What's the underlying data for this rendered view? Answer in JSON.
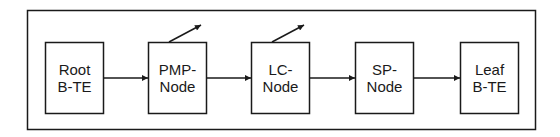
{
  "diagram": {
    "type": "block-flow",
    "colors": {
      "stroke": "#1a1a1a",
      "background": "#ffffff"
    },
    "nodes": [
      {
        "id": "root",
        "lines": [
          "Root",
          "B-TE"
        ],
        "variable": false
      },
      {
        "id": "pmp",
        "lines": [
          "PMP-",
          "Node"
        ],
        "variable": true
      },
      {
        "id": "lc",
        "lines": [
          "LC-",
          "Node"
        ],
        "variable": true
      },
      {
        "id": "sp",
        "lines": [
          "SP-",
          "Node"
        ],
        "variable": false
      },
      {
        "id": "leaf",
        "lines": [
          "Leaf",
          "B-TE"
        ],
        "variable": false
      }
    ],
    "edges": [
      {
        "from": "root",
        "to": "pmp"
      },
      {
        "from": "pmp",
        "to": "lc"
      },
      {
        "from": "lc",
        "to": "sp"
      },
      {
        "from": "sp",
        "to": "leaf"
      }
    ]
  }
}
